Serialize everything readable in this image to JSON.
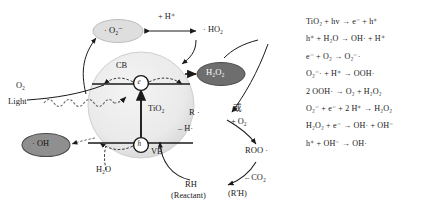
{
  "diagram": {
    "particle_label": "TiO₂",
    "bands": {
      "cb": "CB",
      "vb": "VB"
    },
    "carriers": {
      "electron": "e",
      "hole": "h"
    },
    "light_label": "Light",
    "species": {
      "oxygen": "O₂",
      "water": "H₂O",
      "superoxide": "· O₂⁻",
      "hydroperoxyl": "· HO₂",
      "hydrogen_peroxide": "H₂O₂",
      "hydroxyl_radical": "· OH"
    },
    "labels": {
      "plus_proton": "+ H⁺",
      "minus_h_radical": "– H·",
      "plus_o2": "+ O₂",
      "minus_co2": "– CO₂",
      "or_chinese": "或"
    },
    "cycle": {
      "carbon_radical": "R ·",
      "peroxy_radical": "ROO ·",
      "reactant": "RH",
      "reactant_note": "(Reactant)",
      "product": "(R'H)"
    },
    "colors": {
      "particle_fill": "#e9e9e9",
      "superoxide_fill": "#dcdcdc",
      "peroxide_fill": "#6e6e6e",
      "hydroxyl_fill": "#8f8f8f",
      "stroke": "#1a1a1a"
    }
  },
  "equations": [
    "TiO₂ + hv → e⁻ + h⁺",
    "h⁺ + H₂O → OH· + H⁺",
    "e⁻ + O₂ → O₂⁻·",
    "O₂⁻· + H⁺ → OOH·",
    "2 OOH· → O₂ + H₂O₂",
    "O₂⁻ + e⁻ + 2 H⁺ → H₂O₂",
    "H₂O₂ + e⁻ → OH· + OH⁻",
    "h⁺ + OH⁻ → OH·"
  ]
}
